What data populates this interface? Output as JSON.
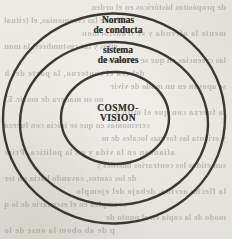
{
  "diagram": {
    "type": "concentric-circles",
    "ink_color": "#2e2b25",
    "rings": [
      {
        "name": "outer",
        "label": "Normas\nde conducta"
      },
      {
        "name": "middle",
        "label": "sistema\nde valores"
      },
      {
        "name": "inner",
        "label": "COSMO-\nVISION"
      }
    ]
  },
  "page": {
    "paper_color": "#e8e6e1"
  },
  "bleed": {
    "style": "illegible show-through print from reverse side",
    "lines": [
      "de propósitos históricos en el orden",
      "ción de las ceremonias, el (ritual",
      "mente la ofrenda y se transforman",
      "ritos y las costumbres, la man",
      "las creencias en que se crean los",
      "deberá el contorno, la parte del h",
      "se apoyan en un modo de vivir",
      "no su manera de morir. El",
      "la fuerza con que el mito g",
      "ceremonias en que se inicia con fuerza",
      "y orienta las formas locales de m",
      "afianzan en la vida y en la política. Prim",
      "sometidos los contrarios hostiles y",
      "de los santos, cavando hacia un ter",
      "la flecha arriba, debajo del ejemplo",
      "se emplea en el escenario de lo q",
      "modo de la copia en el punto de",
      "p de ab obom la onse de lo"
    ]
  }
}
